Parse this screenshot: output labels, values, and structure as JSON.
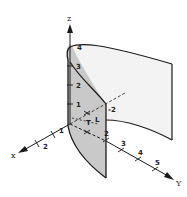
{
  "figure": {
    "axes": {
      "z": {
        "label": "z",
        "ticks": [
          "1",
          "2",
          "3",
          "4"
        ]
      },
      "x": {
        "label": "x",
        "ticks": [
          "1",
          "2"
        ]
      },
      "y": {
        "label": "Y",
        "ticks": [
          "2",
          "3",
          "4",
          "5"
        ]
      }
    },
    "annotations": {
      "neg_two": "-2",
      "origin_mark": "T",
      "l_mark": "L"
    },
    "colors": {
      "line": "#1a1a1a",
      "front_sheet": "#c9c9c9",
      "back_sheet": "#f3f3f3",
      "background": "#ffffff"
    }
  }
}
